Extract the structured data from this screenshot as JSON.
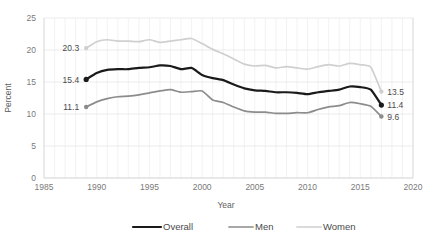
{
  "chart_data": {
    "type": "line",
    "title": "",
    "xlabel": "Year",
    "ylabel": "Percent",
    "xlim": [
      1985,
      2020
    ],
    "ylim": [
      0,
      25
    ],
    "grid": true,
    "legend_position": "bottom",
    "x_ticks": [
      "1985",
      "1990",
      "1995",
      "2000",
      "2005",
      "2010",
      "2015",
      "2020"
    ],
    "y_ticks": [
      "0",
      "5",
      "10",
      "15",
      "20",
      "25"
    ],
    "x": [
      1989,
      1990,
      1991,
      1992,
      1993,
      1994,
      1995,
      1996,
      1997,
      1998,
      1999,
      2000,
      2001,
      2002,
      2003,
      2004,
      2005,
      2006,
      2007,
      2008,
      2009,
      2010,
      2011,
      2012,
      2013,
      2014,
      2015,
      2016,
      2017
    ],
    "series": [
      {
        "name": "Overall",
        "color": "#1a1a1a",
        "start_label": "15.4",
        "end_label": "11.4",
        "values": [
          15.4,
          16.4,
          16.9,
          17.0,
          17.0,
          17.2,
          17.3,
          17.6,
          17.5,
          17.0,
          17.2,
          16.1,
          15.6,
          15.3,
          14.6,
          14.0,
          13.7,
          13.6,
          13.4,
          13.4,
          13.3,
          13.1,
          13.4,
          13.6,
          13.8,
          14.3,
          14.2,
          13.8,
          11.4
        ]
      },
      {
        "name": "Men",
        "color": "#8c8c8c",
        "start_label": "11.1",
        "end_label": "9.6",
        "values": [
          11.1,
          11.9,
          12.4,
          12.7,
          12.8,
          13.0,
          13.3,
          13.6,
          13.8,
          13.4,
          13.5,
          13.6,
          12.2,
          11.8,
          11.1,
          10.5,
          10.3,
          10.3,
          10.1,
          10.1,
          10.2,
          10.2,
          10.7,
          11.1,
          11.3,
          11.8,
          11.6,
          11.2,
          9.6
        ]
      },
      {
        "name": "Women",
        "color": "#cfcfcf",
        "start_label": "20.3",
        "end_label": "13.5",
        "values": [
          20.3,
          21.3,
          21.6,
          21.4,
          21.4,
          21.3,
          21.6,
          21.2,
          21.4,
          21.6,
          21.8,
          21.0,
          20.1,
          19.4,
          18.6,
          17.8,
          17.5,
          17.6,
          17.2,
          17.4,
          17.2,
          17.0,
          17.4,
          17.7,
          17.5,
          17.9,
          17.7,
          17.3,
          13.5
        ]
      }
    ]
  },
  "legend": {
    "items": [
      {
        "label": "Overall"
      },
      {
        "label": "Men"
      },
      {
        "label": "Women"
      }
    ]
  }
}
